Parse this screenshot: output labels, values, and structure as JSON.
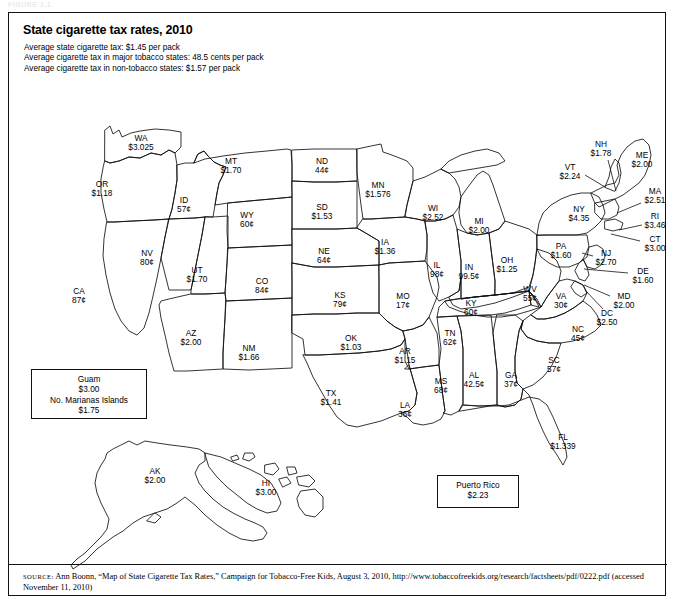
{
  "figure_tag": "FIGURE 1.1",
  "title": "State cigarette tax rates, 2010",
  "notes": [
    "Average state cigarette tax: $1.45 per pack",
    "Average cigarette tax in major tobacco states: 48.5 cents per pack",
    "Average cigarette tax in non-tobacco states: $1.57 per pack"
  ],
  "source": {
    "label": "SOURCE:",
    "text": " Ann Boonn, “Map of State Cigarette Tax Rates,” Campaign for Tobacco-Free Kids, August 3, 2010, http://www.tobaccofreekids.org/research/factsheets/pdf/0222.pdf (accessed November 11, 2010)"
  },
  "insets": [
    {
      "name": "guam-marianas-box",
      "lines": [
        "Guam",
        "$3.00",
        "No. Marianas Islands",
        "$1.75"
      ]
    },
    {
      "name": "puerto-rico-box",
      "lines": [
        "Puerto Rico",
        "$2.23"
      ]
    }
  ],
  "chart_data": {
    "type": "map",
    "title": "State cigarette tax rates, 2010",
    "unit": "US dollars or cents per pack of cigarettes",
    "legend": "none",
    "grid": false,
    "annotations": [
      "Average state cigarette tax: $1.45 per pack",
      "Average cigarette tax in major tobacco states: 48.5 cents per pack",
      "Average cigarette tax in non-tobacco states: $1.57 per pack"
    ],
    "territories": [
      {
        "code": "Guam",
        "value": "$3.00"
      },
      {
        "code": "No. Marianas Islands",
        "value": "$1.75"
      },
      {
        "code": "Puerto Rico",
        "value": "$2.23"
      }
    ],
    "states": [
      {
        "code": "WA",
        "value": "$3.025",
        "x": 132,
        "y": 130,
        "leader": null
      },
      {
        "code": "OR",
        "value": "$1.18",
        "x": 93,
        "y": 176,
        "leader": null
      },
      {
        "code": "CA",
        "value": "87¢",
        "x": 70,
        "y": 283,
        "leader": null
      },
      {
        "code": "NV",
        "value": "80¢",
        "x": 138,
        "y": 245,
        "leader": null
      },
      {
        "code": "ID",
        "value": "57¢",
        "x": 175,
        "y": 192,
        "leader": null
      },
      {
        "code": "MT",
        "value": "$1.70",
        "x": 222,
        "y": 153,
        "leader": null
      },
      {
        "code": "WY",
        "value": "60¢",
        "x": 238,
        "y": 207,
        "leader": null
      },
      {
        "code": "UT",
        "value": "$1.70",
        "x": 188,
        "y": 262,
        "leader": null
      },
      {
        "code": "AZ",
        "value": "$2.00",
        "x": 182,
        "y": 325,
        "leader": null
      },
      {
        "code": "CO",
        "value": "84¢",
        "x": 253,
        "y": 273,
        "leader": null
      },
      {
        "code": "NM",
        "value": "$1.66",
        "x": 240,
        "y": 340,
        "leader": null
      },
      {
        "code": "ND",
        "value": "44¢",
        "x": 313,
        "y": 153,
        "leader": null
      },
      {
        "code": "SD",
        "value": "$1.53",
        "x": 313,
        "y": 199,
        "leader": null
      },
      {
        "code": "NE",
        "value": "64¢",
        "x": 315,
        "y": 243,
        "leader": null
      },
      {
        "code": "KS",
        "value": "79¢",
        "x": 331,
        "y": 287,
        "leader": null
      },
      {
        "code": "OK",
        "value": "$1.03",
        "x": 342,
        "y": 330,
        "leader": null
      },
      {
        "code": "TX",
        "value": "$1.41",
        "x": 322,
        "y": 385,
        "leader": null
      },
      {
        "code": "MN",
        "value": "$1.576",
        "x": 369,
        "y": 177,
        "leader": null
      },
      {
        "code": "IA",
        "value": "$1.36",
        "x": 376,
        "y": 234,
        "leader": null
      },
      {
        "code": "MO",
        "value": "17¢",
        "x": 394,
        "y": 288,
        "leader": null
      },
      {
        "code": "AR",
        "value": "$1.15",
        "x": 396,
        "y": 343,
        "leader": null
      },
      {
        "code": "LA",
        "value": "36¢",
        "x": 396,
        "y": 397,
        "leader": null
      },
      {
        "code": "MS",
        "value": "68¢",
        "x": 432,
        "y": 373,
        "leader": null
      },
      {
        "code": "AL",
        "value": "42.5¢",
        "x": 465,
        "y": 367,
        "leader": null
      },
      {
        "code": "TN",
        "value": "62¢",
        "x": 441,
        "y": 325,
        "leader": null
      },
      {
        "code": "WI",
        "value": "$2.52",
        "x": 424,
        "y": 200,
        "leader": null
      },
      {
        "code": "IL",
        "value": "98¢",
        "x": 428,
        "y": 257,
        "leader": null
      },
      {
        "code": "IN",
        "value": "99.5¢",
        "x": 460,
        "y": 259,
        "leader": null
      },
      {
        "code": "MI",
        "value": "$2.00",
        "x": 470,
        "y": 213,
        "leader": null
      },
      {
        "code": "OH",
        "value": "$1.25",
        "x": 498,
        "y": 252,
        "leader": null
      },
      {
        "code": "KY",
        "value": "60¢",
        "x": 462,
        "y": 295,
        "leader": null
      },
      {
        "code": "WV",
        "value": "55¢",
        "x": 521,
        "y": 281,
        "leader": null
      },
      {
        "code": "VA",
        "value": "30¢",
        "x": 552,
        "y": 288,
        "leader": null
      },
      {
        "code": "NC",
        "value": "45¢",
        "x": 569,
        "y": 321,
        "leader": null
      },
      {
        "code": "SC",
        "value": "57¢",
        "x": 545,
        "y": 352,
        "leader": null
      },
      {
        "code": "GA",
        "value": "37¢",
        "x": 502,
        "y": 367,
        "leader": null
      },
      {
        "code": "FL",
        "value": "$1.339",
        "x": 554,
        "y": 429,
        "leader": null
      },
      {
        "code": "PA",
        "value": "$1.60",
        "x": 552,
        "y": 238,
        "leader": null
      },
      {
        "code": "NY",
        "value": "$4.35",
        "x": 570,
        "y": 201,
        "leader": null
      },
      {
        "code": "VT",
        "value": "$2.24",
        "x": 561,
        "y": 159,
        "leader": [
          576,
          162,
          596,
          174
        ]
      },
      {
        "code": "NH",
        "value": "$1.78",
        "x": 592,
        "y": 136,
        "leader": [
          599,
          147,
          607,
          178
        ]
      },
      {
        "code": "ME",
        "value": "$2.00",
        "x": 633,
        "y": 147,
        "leader": null
      },
      {
        "code": "MA",
        "value": "$2.51",
        "x": 646,
        "y": 183,
        "leader": [
          632,
          190,
          608,
          200
        ]
      },
      {
        "code": "RI",
        "value": "$3.46",
        "x": 646,
        "y": 208,
        "leader": [
          633,
          212,
          610,
          217
        ]
      },
      {
        "code": "CT",
        "value": "$3.00",
        "x": 646,
        "y": 231,
        "leader": [
          631,
          228,
          602,
          221
        ]
      },
      {
        "code": "NJ",
        "value": "$2.70",
        "x": 597,
        "y": 245,
        "leader": [
          584,
          243,
          573,
          240
        ]
      },
      {
        "code": "DE",
        "value": "$1.60",
        "x": 634,
        "y": 263,
        "leader": [
          619,
          260,
          575,
          256
        ]
      },
      {
        "code": "MD",
        "value": "$2.00",
        "x": 615,
        "y": 288,
        "leader": [
          601,
          283,
          575,
          272
        ]
      },
      {
        "code": "DC",
        "value": "$2.50",
        "x": 598,
        "y": 305,
        "leader": [
          594,
          296,
          576,
          277
        ]
      },
      {
        "code": "AK",
        "value": "$2.00",
        "x": 146,
        "y": 463,
        "leader": null
      },
      {
        "code": "HI",
        "value": "$3.00",
        "x": 257,
        "y": 475,
        "leader": null
      }
    ]
  }
}
